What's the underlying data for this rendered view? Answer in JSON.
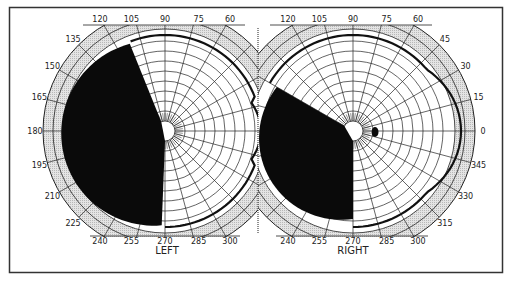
{
  "figure": {
    "type": "visual-field-perimetry-chart"
  },
  "colors": {
    "background": "#ffffff",
    "frame": "#333333",
    "grid": "#222222",
    "outer_band": "#d8d8d8",
    "defect_fill": "#0a0a0a",
    "isopter": "#111111"
  },
  "charts": [
    {
      "id": "left",
      "label": "LEFT",
      "center": [
        165,
        131
      ],
      "angle_labels": [
        "120",
        "105",
        "90",
        "75",
        "60",
        "135",
        "150",
        "165",
        "180",
        "195",
        "210",
        "225",
        "240",
        "255",
        "270",
        "285",
        "300"
      ],
      "visible_angle_labels": [
        {
          "deg": 120,
          "text": "120"
        },
        {
          "deg": 105,
          "text": "105"
        },
        {
          "deg": 90,
          "text": "90"
        },
        {
          "deg": 75,
          "text": "75"
        },
        {
          "deg": 60,
          "text": "60"
        },
        {
          "deg": 135,
          "text": "135"
        },
        {
          "deg": 150,
          "text": "150"
        },
        {
          "deg": 165,
          "text": "165"
        },
        {
          "deg": 180,
          "text": "180"
        },
        {
          "deg": 195,
          "text": "195"
        },
        {
          "deg": 210,
          "text": "210"
        },
        {
          "deg": 225,
          "text": "225"
        },
        {
          "deg": 240,
          "text": "240"
        },
        {
          "deg": 255,
          "text": "255"
        },
        {
          "deg": 270,
          "text": "270"
        },
        {
          "deg": 285,
          "text": "285"
        },
        {
          "deg": 300,
          "text": "300"
        }
      ],
      "defect": {
        "from_deg": 112,
        "to_deg": 270,
        "description": "dense field loss"
      },
      "blind_spot": null
    },
    {
      "id": "right",
      "label": "RIGHT",
      "center": [
        353,
        131
      ],
      "visible_angle_labels": [
        {
          "deg": 120,
          "text": "120"
        },
        {
          "deg": 105,
          "text": "105"
        },
        {
          "deg": 90,
          "text": "90"
        },
        {
          "deg": 75,
          "text": "75"
        },
        {
          "deg": 60,
          "text": "60"
        },
        {
          "deg": 45,
          "text": "45"
        },
        {
          "deg": 30,
          "text": "30"
        },
        {
          "deg": 15,
          "text": "15"
        },
        {
          "deg": 0,
          "text": "0"
        },
        {
          "deg": 345,
          "text": "345"
        },
        {
          "deg": 330,
          "text": "330"
        },
        {
          "deg": 315,
          "text": "315"
        },
        {
          "deg": 240,
          "text": "240"
        },
        {
          "deg": 255,
          "text": "255"
        },
        {
          "deg": 270,
          "text": "270"
        },
        {
          "deg": 285,
          "text": "285"
        },
        {
          "deg": 300,
          "text": "300"
        }
      ],
      "defect": {
        "from_deg": 150,
        "to_deg": 270,
        "description": "dense field loss"
      },
      "blind_spot": {
        "deg": 0,
        "description": "physiologic blind spot"
      }
    }
  ]
}
